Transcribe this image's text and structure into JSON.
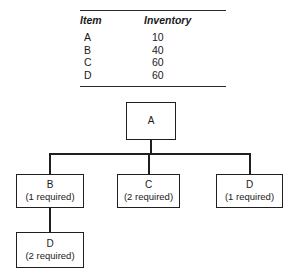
{
  "table": {
    "headers": {
      "item": "Item",
      "inventory": "Inventory"
    },
    "rows": [
      {
        "item": "A",
        "inventory": "10"
      },
      {
        "item": "B",
        "inventory": "40"
      },
      {
        "item": "C",
        "inventory": "60"
      },
      {
        "item": "D",
        "inventory": "60"
      }
    ]
  },
  "tree": {
    "nodes": {
      "a": {
        "label": "A",
        "qty": ""
      },
      "b": {
        "label": "B",
        "qty": "(1 required)"
      },
      "c": {
        "label": "C",
        "qty": "(2 required)"
      },
      "d_right": {
        "label": "D",
        "qty": "(1 required)"
      },
      "d_bottom": {
        "label": "D",
        "qty": "(2 required)"
      }
    }
  },
  "colors": {
    "line": "#1f1f1f",
    "text": "#1a1a1a",
    "background": "#ffffff"
  }
}
